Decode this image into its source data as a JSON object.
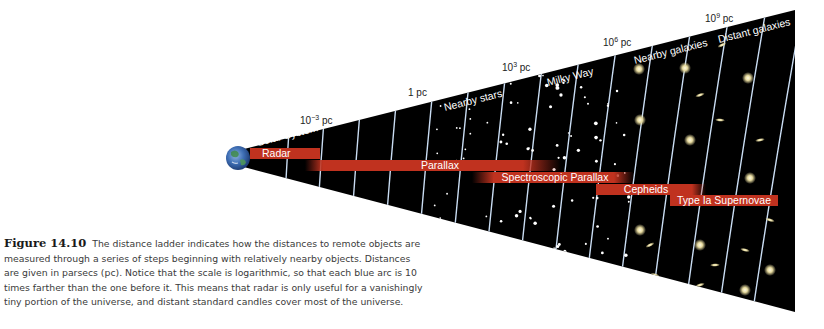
{
  "figure": {
    "label": "Figure 14.10",
    "caption": "The distance ladder indicates how the distances to remote objects are measured through a series of steps beginning with relatively nearby objects. Distances are given in parsecs (pc). Notice that the scale is logarithmic, so that each blue arc is 10 times farther than the one before it. This means that radar is only useful for a vanishingly tiny portion of the universe, and distant standard candles cover most of the universe."
  },
  "scale": {
    "unit": "pc",
    "arc_step_factor": 10,
    "distance_labels": [
      {
        "base": "10",
        "exp": "−3",
        "unit": "pc"
      },
      {
        "base": "1",
        "exp": "",
        "unit": "pc"
      },
      {
        "base": "10",
        "exp": "3",
        "unit": "pc"
      },
      {
        "base": "10",
        "exp": "6",
        "unit": "pc"
      },
      {
        "base": "10",
        "exp": "9",
        "unit": "pc"
      }
    ]
  },
  "regions": [
    "Solar System",
    "Nearby stars",
    "Milky Way",
    "Nearby galaxies",
    "Distant galaxies"
  ],
  "methods": [
    {
      "name": "Radar"
    },
    {
      "name": "Parallax"
    },
    {
      "name": "Spectroscopic Parallax"
    },
    {
      "name": "Cepheids"
    },
    {
      "name": "Type Ia Supernovae"
    }
  ],
  "colors": {
    "background": "#ffffff",
    "space": "#000000",
    "arc": "#c9dcf2",
    "method_bar": "#c0321f",
    "label_text": "#ffffff",
    "caption_text": "#3a3a3a"
  }
}
